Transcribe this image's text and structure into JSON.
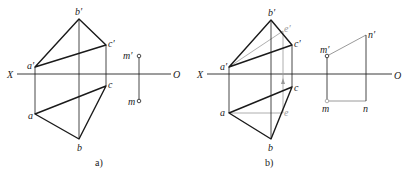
{
  "figure": {
    "colors": {
      "line": "#1a1a1a",
      "construction": "#9a9a9a",
      "axis": "#3a3a3a"
    }
  },
  "panel_a": {
    "caption": "a)",
    "axis": {
      "left_label": "X",
      "right_label": "O"
    },
    "points": {
      "a_prime": {
        "label": "a′",
        "x": 35,
        "y": 67
      },
      "b_prime": {
        "label": "b′",
        "x": 79,
        "y": 19
      },
      "c_prime": {
        "label": "c′",
        "x": 106,
        "y": 45
      },
      "a": {
        "label": "a",
        "x": 35,
        "y": 114
      },
      "b": {
        "label": "b",
        "x": 79,
        "y": 139
      },
      "c": {
        "label": "c",
        "x": 106,
        "y": 86
      },
      "m_prime": {
        "label": "m′",
        "x": 139,
        "y": 56
      },
      "m": {
        "label": "m",
        "x": 139,
        "y": 101
      }
    }
  },
  "panel_b": {
    "caption": "b)",
    "axis": {
      "left_label": "X",
      "right_label": "O"
    },
    "points": {
      "a_prime": {
        "label": "a′",
        "x": 229,
        "y": 67
      },
      "b_prime": {
        "label": "b′",
        "x": 271,
        "y": 20
      },
      "c_prime": {
        "label": "c′",
        "x": 292,
        "y": 45
      },
      "e_prime": {
        "label": "e′",
        "x": 283,
        "y": 31
      },
      "a": {
        "label": "a",
        "x": 229,
        "y": 113
      },
      "b": {
        "label": "b",
        "x": 271,
        "y": 139
      },
      "c": {
        "label": "c",
        "x": 292,
        "y": 87
      },
      "e": {
        "label": "e",
        "x": 283,
        "y": 113
      },
      "m_prime": {
        "label": "m′",
        "x": 327,
        "y": 56
      },
      "n_prime": {
        "label": "n′",
        "x": 366,
        "y": 35
      },
      "m": {
        "label": "m",
        "x": 327,
        "y": 101
      },
      "n": {
        "label": "n",
        "x": 366,
        "y": 101
      }
    }
  }
}
